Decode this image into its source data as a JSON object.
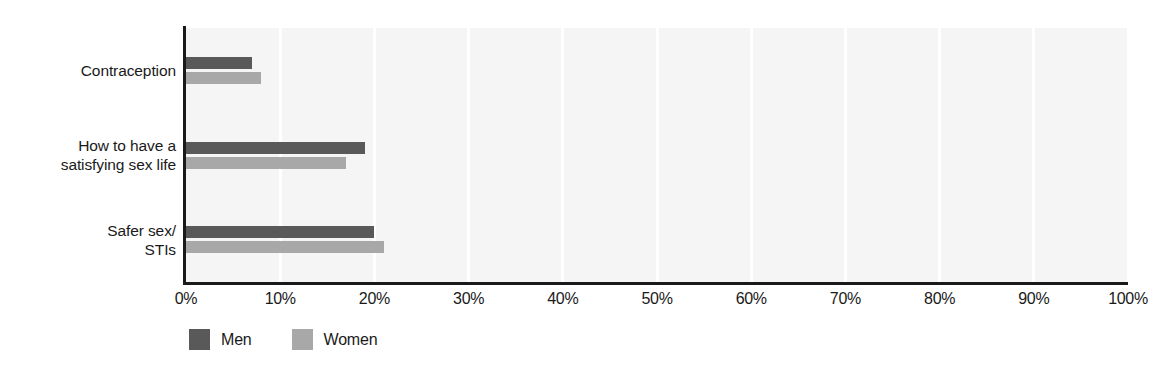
{
  "chart_data": {
    "type": "bar",
    "orientation": "horizontal",
    "title": "",
    "xlabel": "",
    "ylabel": "",
    "xlim": [
      0,
      100
    ],
    "xtick_labels": [
      "0%",
      "10%",
      "20%",
      "30%",
      "40%",
      "50%",
      "60%",
      "70%",
      "80%",
      "90%",
      "100%"
    ],
    "xticks": [
      0,
      10,
      20,
      30,
      40,
      50,
      60,
      70,
      80,
      90,
      100
    ],
    "grid": "vertical-only",
    "legend_position": "bottom-left",
    "categories": [
      "Contraception",
      "How to have a\nsatisfying sex life",
      "Safer sex/\nSTIs"
    ],
    "series": [
      {
        "name": "Men",
        "color": "#595959",
        "values": [
          7,
          19,
          20
        ]
      },
      {
        "name": "Women",
        "color": "#a8a8a8",
        "values": [
          8,
          17,
          21
        ]
      }
    ]
  },
  "legend": {
    "items": [
      {
        "label": "Men",
        "swatch": "men-swatch"
      },
      {
        "label": "Women",
        "swatch": "women-swatch"
      }
    ]
  },
  "colors": {
    "men": "#595959",
    "women": "#a8a8a8",
    "plot_background": "#f5f5f5",
    "gridline": "#ffffff",
    "axis": "#1a1a1a",
    "text": "#1a1a1a"
  }
}
